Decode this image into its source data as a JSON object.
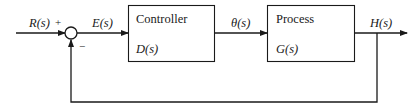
{
  "diagram": {
    "type": "feedback-control-block-diagram",
    "signals": {
      "input": "R(s)",
      "error": "E(s)",
      "control": "θ(s)",
      "output": "H(s)"
    },
    "summing_junction": {
      "plus_sign": "+",
      "minus_sign": "−"
    },
    "blocks": [
      {
        "title": "Controller",
        "transfer_function": "D(s)"
      },
      {
        "title": "Process",
        "transfer_function": "G(s)"
      }
    ],
    "colors": {
      "line": "#1a1a1a",
      "background": "#ffffff"
    }
  }
}
